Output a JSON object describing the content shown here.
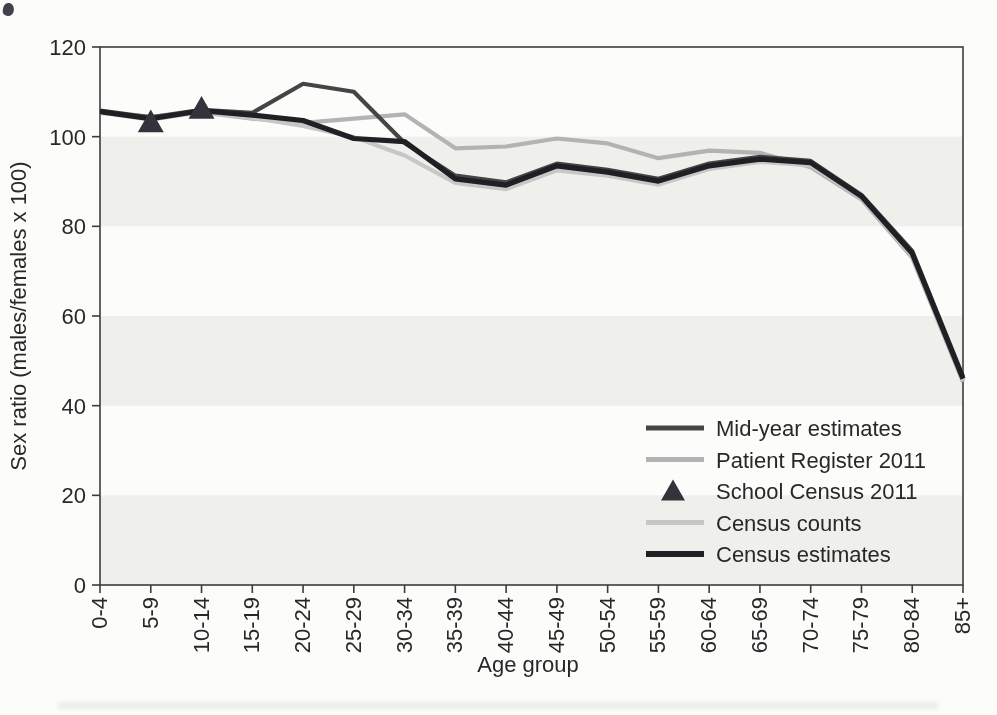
{
  "page": {
    "background": "#fcfcfb",
    "artifact_smudge_color": "#41414a"
  },
  "chart_data": {
    "type": "line",
    "title": "",
    "xlabel": "Age group",
    "ylabel": "Sex ratio (males/females x 100)",
    "ylim": [
      0,
      120
    ],
    "yticks": [
      0,
      20,
      40,
      60,
      80,
      100,
      120
    ],
    "grid": false,
    "axis_color": "#3c3c3c",
    "plot_bands": {
      "fill": "#efefec",
      "ranges": [
        [
          0,
          20
        ],
        [
          40,
          60
        ],
        [
          80,
          100
        ]
      ]
    },
    "categories": [
      "0-4",
      "5-9",
      "10-14",
      "15-19",
      "20-24",
      "25-29",
      "30-34",
      "35-39",
      "40-44",
      "45-49",
      "50-54",
      "55-59",
      "60-64",
      "65-69",
      "70-74",
      "75-79",
      "80-84",
      "85+"
    ],
    "series": [
      {
        "name": "Mid-year estimates",
        "kind": "line",
        "color": "#454545",
        "stroke_width": 4.2,
        "values": [
          105.8,
          104.3,
          106.0,
          105.3,
          111.8,
          110.0,
          98.6,
          91.3,
          89.8,
          94.0,
          92.6,
          90.6,
          94.0,
          95.5,
          94.6,
          87.0,
          74.5,
          46.5
        ]
      },
      {
        "name": "Patient Register 2011",
        "kind": "line",
        "color": "#b3b3b3",
        "stroke_width": 4.2,
        "values": [
          105.3,
          104.5,
          105.4,
          104.0,
          103.1,
          104.0,
          105.0,
          97.4,
          97.8,
          99.6,
          98.5,
          95.2,
          96.9,
          96.4,
          93.2,
          86.0,
          73.0,
          45.3
        ]
      },
      {
        "name": "School Census 2011",
        "kind": "scatter",
        "marker": "triangle",
        "color": "#33333b",
        "values": [
          null,
          103.3,
          106.3,
          null,
          null,
          null,
          null,
          null,
          null,
          null,
          null,
          null,
          null,
          null,
          null,
          null,
          null,
          null
        ]
      },
      {
        "name": "Census counts",
        "kind": "line",
        "color": "#c7c7c7",
        "stroke_width": 4.2,
        "values": [
          105.4,
          103.8,
          105.5,
          104.2,
          102.4,
          99.9,
          95.8,
          89.7,
          88.3,
          92.5,
          91.3,
          89.3,
          92.8,
          94.4,
          93.6,
          86.3,
          73.4,
          45.6
        ]
      },
      {
        "name": "Census estimates",
        "kind": "line",
        "color": "#1f1f24",
        "stroke_width": 5.2,
        "values": [
          105.6,
          104.0,
          105.8,
          104.8,
          103.6,
          99.6,
          98.9,
          90.6,
          89.2,
          93.5,
          92.1,
          90.1,
          93.5,
          95.0,
          94.2,
          86.7,
          74.0,
          46.0
        ]
      }
    ],
    "legend": {
      "position": "inside-lower-right",
      "items": [
        "Mid-year estimates",
        "Patient Register 2011",
        "School Census 2011",
        "Census counts",
        "Census estimates"
      ]
    }
  }
}
